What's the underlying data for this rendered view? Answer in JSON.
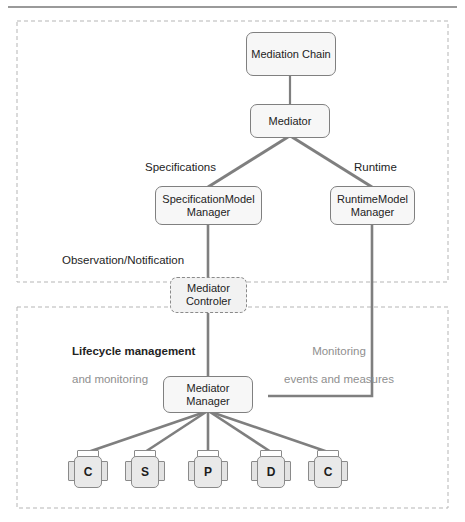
{
  "figure": {
    "top_rule": true,
    "regions": [
      {
        "id": "design-region",
        "name": "upper-dashed-region"
      },
      {
        "id": "runtime-region",
        "name": "lower-dashed-region"
      }
    ]
  },
  "nodes": {
    "mediation_chain": {
      "label": "Mediation Chain",
      "style": "solid"
    },
    "mediator": {
      "label": "Mediator",
      "style": "solid"
    },
    "specification_model_manager": {
      "label": "SpecificationModel\nManager",
      "style": "solid"
    },
    "runtime_model_manager": {
      "label": "RuntimeModel\nManager",
      "style": "solid"
    },
    "mediator_controler": {
      "label": "Mediator\nControler",
      "style": "dashed"
    },
    "mediator_manager": {
      "label": "Mediator\nManager",
      "style": "solid"
    }
  },
  "edge_labels": {
    "specifications": "Specifications",
    "runtime": "Runtime",
    "observation_notification": "Observation/Notification",
    "lifecycle_line1": "Lifecycle management",
    "lifecycle_line2": "and monitoring",
    "monitoring_line1": "Monitoring",
    "monitoring_line2": "events and measures"
  },
  "components": [
    {
      "letter": "C",
      "name": "component-c-1"
    },
    {
      "letter": "S",
      "name": "component-s"
    },
    {
      "letter": "P",
      "name": "component-p"
    },
    {
      "letter": "D",
      "name": "component-d"
    },
    {
      "letter": "C",
      "name": "component-c-2"
    }
  ],
  "colors": {
    "node_fill": "#f7f7f7",
    "node_stroke": "#808080",
    "component_fill": "#e9e9e9",
    "connector": "#7f7f7f",
    "region_border": "#b5b5b5",
    "text": "#232323",
    "muted_text": "#8f8f8f"
  }
}
